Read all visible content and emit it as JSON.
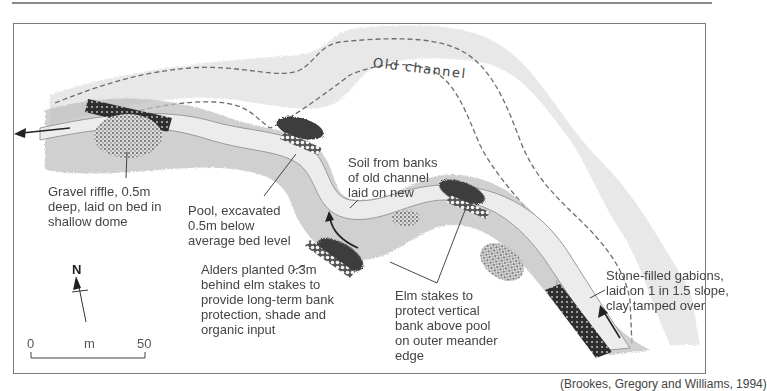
{
  "figure": {
    "old_channel_label": "Old channel",
    "caption_visible_fragment": "(Brookes, Gregory and Williams, 1994)"
  },
  "annotations": {
    "gravel_riffle": [
      "Gravel riffle, 0.5m",
      "deep, laid on bed in",
      "shallow dome"
    ],
    "pool": [
      "Pool, excavated",
      "0.5m below",
      "average bed level"
    ],
    "soil": [
      "Soil from banks",
      "of old channel",
      "laid on new"
    ],
    "alders": [
      "Alders planted 0.3m",
      "behind elm stakes to",
      "provide long-term bank",
      "protection, shade and",
      "organic input"
    ],
    "elm_stakes": [
      "Elm stakes to",
      "protect vertical",
      "bank above pool",
      "on outer meander",
      "edge"
    ],
    "gabions": [
      "Stone-filled gabions,",
      "laid on 1 in 1.5 slope,",
      "clay tamped over"
    ]
  },
  "north_arrow": {
    "letter": "N"
  },
  "scale_bar": {
    "start": "0",
    "unit": "m",
    "end": "50"
  },
  "colors": {
    "frame": "#7b7b7b",
    "bank_texture": "#cfcfcf",
    "channel_water": "#e4e4e4",
    "dark_vegetation": "#3c3c3c",
    "dashed_line": "#6d6d6d"
  }
}
